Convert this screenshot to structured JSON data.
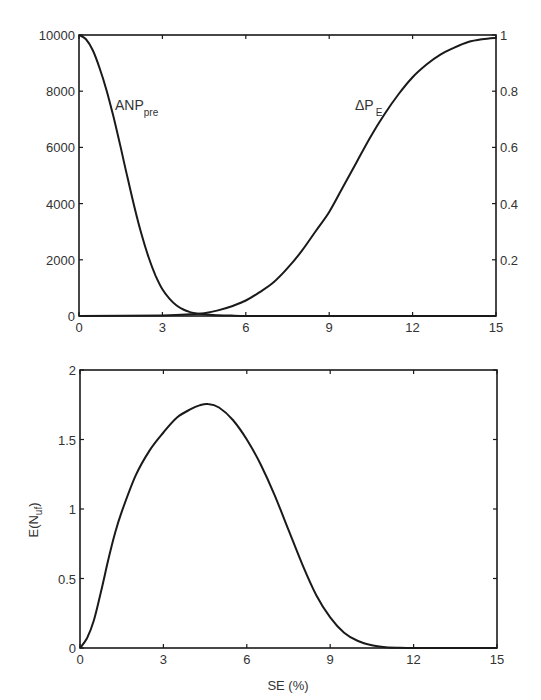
{
  "chart_data": [
    {
      "type": "line",
      "title": "",
      "xlabel": "",
      "ylabel": "",
      "y2label": "",
      "xlim": [
        0,
        15
      ],
      "ylim": [
        0,
        10000
      ],
      "y2lim": [
        0,
        1
      ],
      "grid": false,
      "legend": "inline labels",
      "x_ticks": [
        "0",
        "3",
        "6",
        "9",
        "12",
        "15"
      ],
      "y_ticks": [
        "0",
        "2000",
        "4000",
        "6000",
        "8000",
        "10000"
      ],
      "y2_ticks": [
        "0.2",
        "0.4",
        "0.6",
        "0.8",
        "1"
      ],
      "series": [
        {
          "name": "ANPpre",
          "label_main": "ANP",
          "label_sub": "pre",
          "axis": "left",
          "x": [
            0,
            0.25,
            0.5,
            0.75,
            1,
            1.25,
            1.5,
            1.75,
            2,
            2.25,
            2.5,
            2.75,
            3,
            3.25,
            3.5,
            3.75,
            4,
            4.25,
            4.5,
            5,
            5.5,
            6,
            9,
            12,
            15
          ],
          "values": [
            10000,
            9850,
            9450,
            8800,
            8000,
            7050,
            6000,
            4900,
            3850,
            2900,
            2100,
            1450,
            950,
            620,
            380,
            230,
            140,
            90,
            60,
            30,
            15,
            5,
            0,
            0,
            0
          ]
        },
        {
          "name": "ΔPE",
          "label_main": "ΔP",
          "label_sub": "E",
          "axis": "right",
          "x": [
            0,
            3,
            4,
            4.5,
            5,
            5.5,
            6,
            6.5,
            7,
            7.5,
            8,
            8.5,
            9,
            9.5,
            10,
            10.5,
            11,
            11.5,
            12,
            12.5,
            13,
            13.5,
            14,
            14.5,
            15
          ],
          "values": [
            0,
            0.002,
            0.006,
            0.01,
            0.02,
            0.035,
            0.055,
            0.085,
            0.12,
            0.17,
            0.23,
            0.3,
            0.37,
            0.46,
            0.55,
            0.64,
            0.72,
            0.79,
            0.85,
            0.895,
            0.93,
            0.955,
            0.975,
            0.985,
            0.99
          ]
        }
      ]
    },
    {
      "type": "line",
      "title": "",
      "xlabel": "SE (%)",
      "ylabel": "E(N_uf)",
      "ylabel_main": "E(N",
      "ylabel_sub": "uf",
      "ylabel_end": ")",
      "xlim": [
        0,
        15
      ],
      "ylim": [
        0,
        2
      ],
      "grid": false,
      "legend": "none",
      "x_ticks": [
        "0",
        "3",
        "6",
        "9",
        "12",
        "15"
      ],
      "y_ticks": [
        "0",
        "0.5",
        "1",
        "1.5",
        "2"
      ],
      "series": [
        {
          "name": "E(N_uf)",
          "x": [
            0,
            0.25,
            0.5,
            0.75,
            1,
            1.25,
            1.5,
            2,
            2.5,
            3,
            3.5,
            4,
            4.3,
            4.6,
            5,
            5.5,
            6,
            6.5,
            7,
            7.5,
            8,
            8.5,
            9,
            9.5,
            10,
            10.5,
            11,
            11.5,
            12,
            13,
            14,
            15
          ],
          "values": [
            0,
            0.07,
            0.2,
            0.4,
            0.62,
            0.82,
            0.98,
            1.24,
            1.42,
            1.55,
            1.66,
            1.72,
            1.745,
            1.755,
            1.73,
            1.64,
            1.5,
            1.32,
            1.1,
            0.85,
            0.6,
            0.38,
            0.22,
            0.11,
            0.05,
            0.02,
            0.006,
            0.002,
            0,
            0,
            0,
            0
          ]
        }
      ]
    }
  ],
  "colors": {
    "line": "#1a1a1a",
    "axis": "#1a1a1a",
    "text": "#333333",
    "background": "#ffffff"
  }
}
